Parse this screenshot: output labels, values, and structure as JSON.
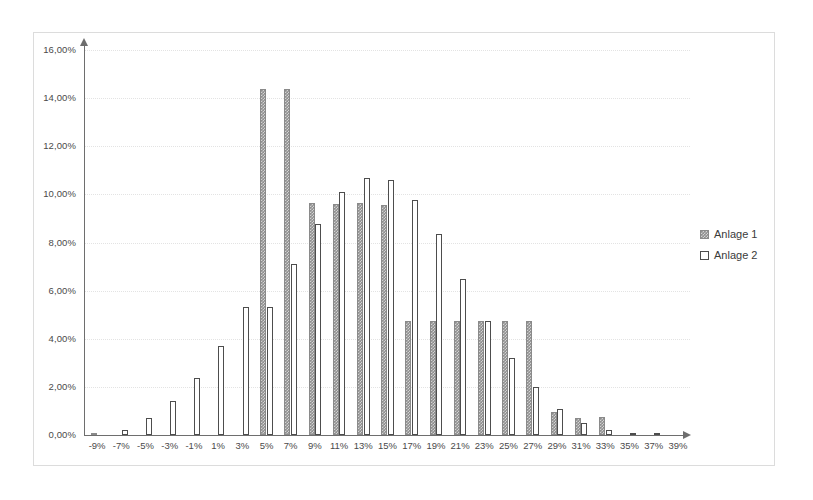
{
  "chart_data": {
    "type": "bar",
    "title": "",
    "subtitle": "",
    "xlabel": "",
    "ylabel": "",
    "grid": true,
    "legend_position": "right",
    "xlim": [
      "-9%",
      "39%"
    ],
    "ylim": [
      0,
      16
    ],
    "y_tick_labels": [
      "0,00%",
      "2,00%",
      "4,00%",
      "6,00%",
      "8,00%",
      "10,00%",
      "12,00%",
      "14,00%",
      "16,00%"
    ],
    "y_tick_values": [
      0,
      2,
      4,
      6,
      8,
      10,
      12,
      14,
      16
    ],
    "categories": [
      "-9%",
      "-7%",
      "-5%",
      "-3%",
      "-1%",
      "1%",
      "3%",
      "5%",
      "7%",
      "9%",
      "11%",
      "13%",
      "15%",
      "17%",
      "19%",
      "21%",
      "23%",
      "25%",
      "27%",
      "29%",
      "31%",
      "33%",
      "35%",
      "37%",
      "39%"
    ],
    "series": [
      {
        "name": "Anlage 1",
        "style": "hatched-gray",
        "color": "#8f8f8f",
        "values": [
          0.1,
          0,
          0,
          0,
          0,
          0,
          0,
          14.4,
          14.4,
          9.65,
          9.6,
          9.65,
          9.55,
          4.75,
          4.75,
          4.75,
          4.75,
          4.75,
          4.75,
          0.95,
          0.7,
          0.75,
          0,
          0,
          0
        ]
      },
      {
        "name": "Anlage 2",
        "style": "white-outline",
        "color": "#ffffff",
        "values": [
          0,
          0.2,
          0.7,
          1.4,
          2.35,
          3.7,
          5.3,
          5.3,
          7.1,
          8.75,
          10.1,
          10.7,
          10.6,
          9.75,
          8.35,
          6.5,
          4.75,
          3.2,
          2.0,
          1.1,
          0.5,
          0.2,
          0.1,
          0.05,
          0
        ]
      }
    ]
  },
  "legend": {
    "items": [
      {
        "label": "Anlage 1",
        "style": "hatched-gray"
      },
      {
        "label": "Anlage 2",
        "style": "white-outline"
      }
    ]
  },
  "axes": {
    "y_axis_name": "percentage-axis",
    "x_axis_name": "return-bucket-axis"
  }
}
